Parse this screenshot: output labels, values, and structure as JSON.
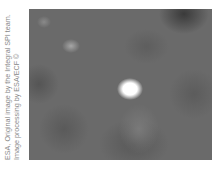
{
  "credit": {
    "line1": "ESA, Original image by the Integral SPI team.",
    "line2": "Image processing by ESA/ECF ©"
  },
  "image": {
    "subject": "gamma-ray sky map",
    "sources": [
      {
        "label": "bright-source",
        "x": 130,
        "y": 88
      },
      {
        "label": "faint-source-1",
        "x": 71,
        "y": 47
      },
      {
        "label": "faint-source-2",
        "x": 44,
        "y": 23
      }
    ]
  }
}
